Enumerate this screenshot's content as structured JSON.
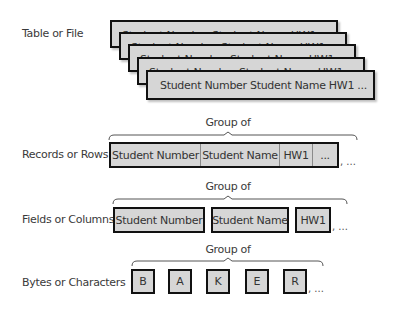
{
  "rows": {
    "table": {
      "label": "Table or File",
      "cards": [
        {
          "text": "Student Number  Student Name  HW1"
        },
        {
          "text": "Student Number  Student Name  HW1"
        },
        {
          "text": "Student Number  Student Name  HW1"
        },
        {
          "text": "Student Number  Student Name  HW1"
        },
        {
          "text": "Student Number  Student Name  HW1  ..."
        }
      ]
    },
    "records": {
      "label": "Records or Rows",
      "group_label": "Group of",
      "cells": [
        "Student Number",
        "Student Name",
        "HW1",
        "..."
      ],
      "trailing": ", ..."
    },
    "fields": {
      "label": "Fields or Columns",
      "group_label": "Group of",
      "items": [
        "Student Number",
        "Student Name",
        "HW1"
      ],
      "trailing": ", ..."
    },
    "bytes": {
      "label": "Bytes or Characters",
      "group_label": "Group of",
      "items": [
        "B",
        "A",
        "K",
        "E",
        "R"
      ],
      "trailing": ", ..."
    }
  },
  "colors": {
    "box_fill": "#d6d6d6",
    "box_border": "#111111",
    "text": "#333333"
  }
}
